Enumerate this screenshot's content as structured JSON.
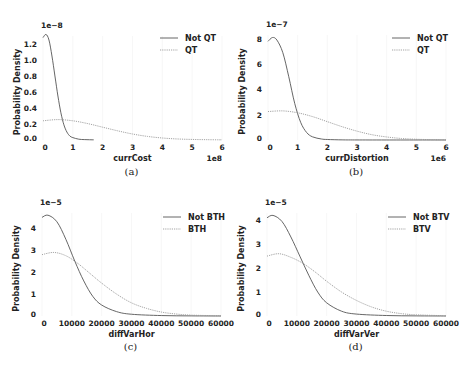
{
  "chart_data": [
    {
      "panel": "a",
      "type": "line",
      "caption": "(a)",
      "xlabel": "currCost",
      "ylabel": "Probability Density",
      "x_scale_label": "1e8",
      "y_scale_label": "1e−8",
      "xticks": [
        "0",
        "1",
        "2",
        "3",
        "4",
        "5",
        "6"
      ],
      "yticks": [
        "0.0",
        "0.2",
        "0.4",
        "0.6",
        "0.8",
        "1.0",
        "1.2"
      ],
      "xlim": [
        0,
        6
      ],
      "ylim": [
        0,
        1.3
      ],
      "legend": [
        "Not QT",
        "QT"
      ],
      "legend_position": "upper right",
      "grid": false,
      "series": [
        {
          "name": "Not QT",
          "style": "solid",
          "x": [
            0,
            0.1,
            0.2,
            0.3,
            0.4,
            0.5,
            0.6,
            0.7,
            0.8,
            0.9,
            1.0,
            1.2,
            1.4,
            1.7
          ],
          "values": [
            1.28,
            1.32,
            1.25,
            1.05,
            0.8,
            0.55,
            0.34,
            0.19,
            0.1,
            0.05,
            0.03,
            0.01,
            0.005,
            0.002
          ]
        },
        {
          "name": "QT",
          "style": "dotted",
          "x": [
            0,
            0.5,
            1,
            1.5,
            2,
            2.5,
            3,
            3.5,
            4,
            4.5,
            5,
            5.5,
            6
          ],
          "values": [
            0.24,
            0.255,
            0.24,
            0.205,
            0.16,
            0.115,
            0.075,
            0.045,
            0.025,
            0.013,
            0.007,
            0.004,
            0.002
          ]
        }
      ]
    },
    {
      "panel": "b",
      "type": "line",
      "caption": "(b)",
      "xlabel": "currDistortion",
      "ylabel": "Probability Density",
      "x_scale_label": "1e6",
      "y_scale_label": "1e−7",
      "xticks": [
        "0",
        "1",
        "2",
        "3",
        "4",
        "5",
        "6"
      ],
      "yticks": [
        "0",
        "2",
        "4",
        "6",
        "8"
      ],
      "xlim": [
        0,
        6
      ],
      "ylim": [
        0,
        8.3
      ],
      "legend": [
        "Not QT",
        "QT"
      ],
      "legend_position": "upper right",
      "grid": false,
      "series": [
        {
          "name": "Not QT",
          "style": "solid",
          "x": [
            0,
            0.15,
            0.3,
            0.5,
            0.7,
            0.9,
            1.1,
            1.3,
            1.5,
            1.8,
            2.0,
            2.5,
            3,
            4,
            6
          ],
          "values": [
            7.8,
            8.1,
            7.9,
            6.9,
            5.0,
            2.9,
            1.4,
            0.6,
            0.25,
            0.08,
            0.04,
            0.01,
            0.004,
            0.001,
            0
          ]
        },
        {
          "name": "QT",
          "style": "dotted",
          "x": [
            0,
            0.5,
            1,
            1.5,
            2,
            2.5,
            3,
            3.5,
            4,
            4.5,
            5,
            5.5,
            6
          ],
          "values": [
            2.25,
            2.3,
            2.15,
            1.85,
            1.45,
            1.05,
            0.7,
            0.42,
            0.24,
            0.12,
            0.06,
            0.03,
            0.01
          ]
        }
      ]
    },
    {
      "panel": "c",
      "type": "line",
      "caption": "(c)",
      "xlabel": "diffVarHor",
      "ylabel": "Probability Density",
      "y_scale_label": "1e−5",
      "xticks": [
        "0",
        "10000",
        "20000",
        "30000",
        "40000",
        "50000",
        "60000"
      ],
      "yticks": [
        "0",
        "1",
        "2",
        "3",
        "4"
      ],
      "xlim": [
        0,
        60000
      ],
      "ylim": [
        0,
        4.7
      ],
      "legend": [
        "Not BTH",
        "BTH"
      ],
      "legend_position": "upper right",
      "grid": false,
      "series": [
        {
          "name": "Not BTH",
          "style": "solid",
          "x": [
            0,
            2000,
            5000,
            8000,
            11000,
            14000,
            17000,
            20000,
            25000,
            30000,
            40000,
            50000,
            60000
          ],
          "values": [
            4.5,
            4.6,
            4.3,
            3.5,
            2.5,
            1.6,
            0.9,
            0.5,
            0.2,
            0.08,
            0.02,
            0.005,
            0
          ]
        },
        {
          "name": "BTH",
          "style": "dotted",
          "x": [
            0,
            4000,
            8000,
            12000,
            16000,
            20000,
            25000,
            30000,
            35000,
            40000,
            45000,
            50000,
            60000
          ],
          "values": [
            2.8,
            2.9,
            2.75,
            2.4,
            1.95,
            1.5,
            1.0,
            0.6,
            0.35,
            0.18,
            0.09,
            0.04,
            0.01
          ]
        }
      ]
    },
    {
      "panel": "d",
      "type": "line",
      "caption": "(d)",
      "xlabel": "diffVarVer",
      "ylabel": "Probability Density",
      "y_scale_label": "1e−5",
      "xticks": [
        "0",
        "10000",
        "20000",
        "30000",
        "40000",
        "50000",
        "60000"
      ],
      "yticks": [
        "0",
        "1",
        "2",
        "3",
        "4"
      ],
      "xlim": [
        0,
        60000
      ],
      "ylim": [
        0,
        4.3
      ],
      "legend": [
        "Not BTV",
        "BTV"
      ],
      "legend_position": "upper right",
      "grid": false,
      "series": [
        {
          "name": "Not BTV",
          "style": "solid",
          "x": [
            0,
            2000,
            5000,
            8000,
            11000,
            14000,
            17000,
            20000,
            25000,
            30000,
            40000,
            50000,
            60000
          ],
          "values": [
            4.1,
            4.2,
            3.95,
            3.3,
            2.5,
            1.7,
            1.0,
            0.55,
            0.2,
            0.08,
            0.02,
            0.005,
            0
          ]
        },
        {
          "name": "BTV",
          "style": "dotted",
          "x": [
            0,
            4000,
            8000,
            12000,
            16000,
            20000,
            25000,
            30000,
            35000,
            40000,
            45000,
            50000,
            60000
          ],
          "values": [
            2.5,
            2.6,
            2.45,
            2.2,
            1.85,
            1.45,
            1.0,
            0.65,
            0.38,
            0.2,
            0.1,
            0.05,
            0.01
          ]
        }
      ]
    }
  ]
}
